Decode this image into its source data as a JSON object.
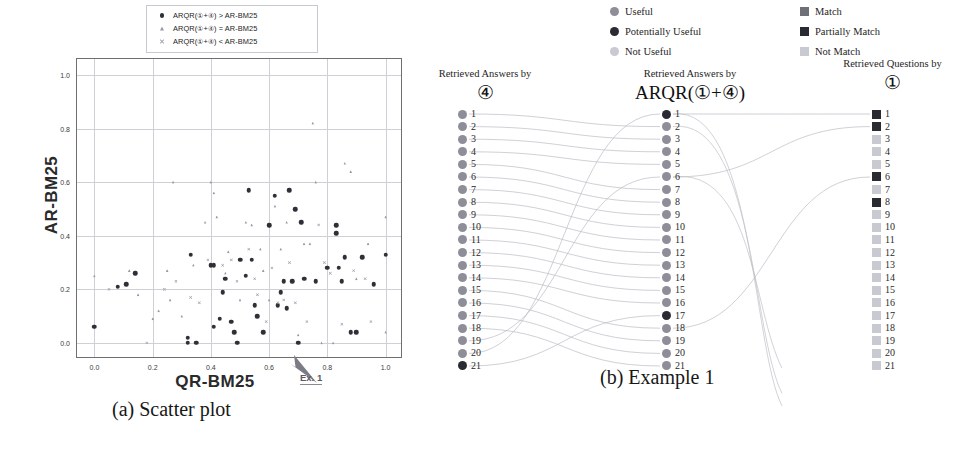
{
  "figure": {
    "caption_a": "(a) Scatter plot",
    "caption_b": "(b) Example 1"
  },
  "chart_data": {
    "type": "scatter",
    "title": "",
    "xlabel": "QR-BM25",
    "ylabel": "AR-BM25",
    "xlim": [
      -0.06,
      1.06
    ],
    "ylim": [
      -0.06,
      1.06
    ],
    "xticks": [
      "0.0",
      "0.2",
      "0.4",
      "0.6",
      "0.8",
      "1.0"
    ],
    "yticks": [
      "0.0",
      "0.2",
      "0.4",
      "0.6",
      "0.8",
      "1.0"
    ],
    "xtick_values": [
      0.0,
      0.2,
      0.4,
      0.6,
      0.8,
      1.0
    ],
    "ytick_values": [
      0.0,
      0.2,
      0.4,
      0.6,
      0.8,
      1.0
    ],
    "grid": true,
    "legend_position": "top-right",
    "annotation": {
      "text": "Ex. 1",
      "points_to_x": 0.7,
      "points_to_y": 0.0
    },
    "series": [
      {
        "name": "ARQR(①+④) > AR-BM25",
        "marker": "filled-circle",
        "color": "#2f2f37",
        "points": [
          [
            0.0,
            0.06
          ],
          [
            0.08,
            0.21
          ],
          [
            0.11,
            0.22
          ],
          [
            0.14,
            0.26
          ],
          [
            0.32,
            0.0
          ],
          [
            0.32,
            0.02
          ],
          [
            0.33,
            0.33
          ],
          [
            0.35,
            0.0
          ],
          [
            0.4,
            0.29
          ],
          [
            0.41,
            0.29
          ],
          [
            0.41,
            0.06
          ],
          [
            0.43,
            0.09
          ],
          [
            0.44,
            0.19
          ],
          [
            0.45,
            0.24
          ],
          [
            0.47,
            0.08
          ],
          [
            0.48,
            0.04
          ],
          [
            0.49,
            0.0
          ],
          [
            0.5,
            0.31
          ],
          [
            0.52,
            0.25
          ],
          [
            0.53,
            0.57
          ],
          [
            0.54,
            0.31
          ],
          [
            0.55,
            0.14
          ],
          [
            0.56,
            0.1
          ],
          [
            0.58,
            0.04
          ],
          [
            0.6,
            0.44
          ],
          [
            0.62,
            0.55
          ],
          [
            0.63,
            0.14
          ],
          [
            0.64,
            0.19
          ],
          [
            0.65,
            0.23
          ],
          [
            0.66,
            0.13
          ],
          [
            0.67,
            0.57
          ],
          [
            0.68,
            0.23
          ],
          [
            0.69,
            0.5
          ],
          [
            0.7,
            0.0
          ],
          [
            0.71,
            0.45
          ],
          [
            0.72,
            0.24
          ],
          [
            0.76,
            0.23
          ],
          [
            0.8,
            0.28
          ],
          [
            0.83,
            0.44
          ],
          [
            0.83,
            0.41
          ],
          [
            0.84,
            0.28
          ],
          [
            0.85,
            0.23
          ],
          [
            0.86,
            0.32
          ],
          [
            0.88,
            0.04
          ],
          [
            0.9,
            0.04
          ],
          [
            0.92,
            0.32
          ],
          [
            0.96,
            0.22
          ],
          [
            1.0,
            0.33
          ]
        ]
      },
      {
        "name": "ARQR(①+④) = AR-BM25",
        "marker": "triangle",
        "color": "#9a9aa4",
        "points": [
          [
            0.0,
            0.25
          ],
          [
            0.12,
            0.27
          ],
          [
            0.15,
            0.18
          ],
          [
            0.2,
            0.09
          ],
          [
            0.22,
            0.12
          ],
          [
            0.25,
            0.27
          ],
          [
            0.26,
            0.16
          ],
          [
            0.27,
            0.6
          ],
          [
            0.3,
            0.1
          ],
          [
            0.34,
            0.29
          ],
          [
            0.38,
            0.45
          ],
          [
            0.4,
            0.6
          ],
          [
            0.41,
            0.56
          ],
          [
            0.42,
            0.47
          ],
          [
            0.45,
            0.26
          ],
          [
            0.46,
            0.34
          ],
          [
            0.5,
            0.16
          ],
          [
            0.52,
            0.45
          ],
          [
            0.54,
            0.44
          ],
          [
            0.57,
            0.35
          ],
          [
            0.58,
            0.27
          ],
          [
            0.6,
            0.16
          ],
          [
            0.62,
            0.51
          ],
          [
            0.64,
            0.35
          ],
          [
            0.66,
            0.45
          ],
          [
            0.7,
            0.03
          ],
          [
            0.72,
            0.37
          ],
          [
            0.74,
            0.37
          ],
          [
            0.75,
            0.82
          ],
          [
            0.76,
            0.6
          ],
          [
            0.78,
            0.0
          ],
          [
            0.82,
            0.0
          ],
          [
            0.86,
            0.67
          ],
          [
            0.88,
            0.64
          ],
          [
            0.9,
            0.24
          ],
          [
            0.94,
            0.37
          ],
          [
            1.0,
            0.47
          ],
          [
            1.0,
            0.04
          ]
        ]
      },
      {
        "name": "ARQR(①+④) < AR-BM25",
        "marker": "cross",
        "color": "#a7a7b0",
        "points": [
          [
            0.05,
            0.2
          ],
          [
            0.18,
            0.0
          ],
          [
            0.24,
            0.2
          ],
          [
            0.28,
            0.23
          ],
          [
            0.33,
            0.17
          ],
          [
            0.36,
            0.15
          ],
          [
            0.39,
            0.31
          ],
          [
            0.44,
            0.29
          ],
          [
            0.47,
            0.31
          ],
          [
            0.49,
            0.23
          ],
          [
            0.53,
            0.35
          ],
          [
            0.55,
            0.24
          ],
          [
            0.56,
            0.18
          ],
          [
            0.59,
            0.08
          ],
          [
            0.61,
            0.28
          ],
          [
            0.63,
            0.15
          ],
          [
            0.65,
            0.16
          ],
          [
            0.67,
            0.3
          ],
          [
            0.69,
            0.15
          ],
          [
            0.73,
            0.08
          ],
          [
            0.77,
            0.44
          ],
          [
            0.79,
            0.3
          ],
          [
            0.81,
            0.26
          ],
          [
            0.85,
            0.07
          ],
          [
            0.89,
            0.27
          ],
          [
            0.93,
            0.24
          ],
          [
            0.95,
            0.08
          ]
        ]
      }
    ]
  },
  "panel_b": {
    "legend": {
      "circle_items": [
        {
          "label": "Useful",
          "color": "#8e8e98"
        },
        {
          "label": "Potentially Useful",
          "color": "#2a2a32"
        },
        {
          "label": "Not Useful",
          "color": "#c9c9d1"
        }
      ],
      "square_items": [
        {
          "label": "Match",
          "color": "#6f6f78"
        },
        {
          "label": "Partially Match",
          "color": "#2a2a32"
        },
        {
          "label": "Not Match",
          "color": "#c9c9d1"
        }
      ]
    },
    "columns": [
      {
        "header_sub": "Retrieved Answers by",
        "header_main": "④",
        "marker_shape": "circle",
        "items": [
          {
            "n": "1",
            "state": "Useful"
          },
          {
            "n": "2",
            "state": "Useful"
          },
          {
            "n": "3",
            "state": "Useful"
          },
          {
            "n": "4",
            "state": "Useful"
          },
          {
            "n": "5",
            "state": "Useful"
          },
          {
            "n": "6",
            "state": "Useful"
          },
          {
            "n": "7",
            "state": "Useful"
          },
          {
            "n": "8",
            "state": "Useful"
          },
          {
            "n": "9",
            "state": "Useful"
          },
          {
            "n": "10",
            "state": "Useful"
          },
          {
            "n": "11",
            "state": "Useful"
          },
          {
            "n": "12",
            "state": "Useful"
          },
          {
            "n": "13",
            "state": "Useful"
          },
          {
            "n": "14",
            "state": "Useful"
          },
          {
            "n": "15",
            "state": "Useful"
          },
          {
            "n": "16",
            "state": "Useful"
          },
          {
            "n": "17",
            "state": "Useful"
          },
          {
            "n": "18",
            "state": "Useful"
          },
          {
            "n": "19",
            "state": "Useful"
          },
          {
            "n": "20",
            "state": "Useful"
          },
          {
            "n": "21",
            "state": "Potentially Useful"
          }
        ]
      },
      {
        "header_sub": "Retrieved Answers by",
        "header_main": "ARQR(①+④)",
        "marker_shape": "circle",
        "items": [
          {
            "n": "1",
            "state": "Potentially Useful"
          },
          {
            "n": "2",
            "state": "Useful"
          },
          {
            "n": "3",
            "state": "Useful"
          },
          {
            "n": "4",
            "state": "Useful"
          },
          {
            "n": "5",
            "state": "Useful"
          },
          {
            "n": "6",
            "state": "Useful"
          },
          {
            "n": "7",
            "state": "Useful"
          },
          {
            "n": "8",
            "state": "Useful"
          },
          {
            "n": "9",
            "state": "Useful"
          },
          {
            "n": "10",
            "state": "Useful"
          },
          {
            "n": "11",
            "state": "Useful"
          },
          {
            "n": "12",
            "state": "Useful"
          },
          {
            "n": "13",
            "state": "Useful"
          },
          {
            "n": "14",
            "state": "Useful"
          },
          {
            "n": "15",
            "state": "Useful"
          },
          {
            "n": "16",
            "state": "Useful"
          },
          {
            "n": "17",
            "state": "Potentially Useful"
          },
          {
            "n": "18",
            "state": "Useful"
          },
          {
            "n": "19",
            "state": "Useful"
          },
          {
            "n": "20",
            "state": "Useful"
          },
          {
            "n": "21",
            "state": "Useful"
          }
        ]
      },
      {
        "header_sub": "Retrieved Questions by",
        "header_main": "①",
        "marker_shape": "square",
        "items": [
          {
            "n": "1",
            "state": "Partially Match"
          },
          {
            "n": "2",
            "state": "Partially Match"
          },
          {
            "n": "3",
            "state": "Not Match"
          },
          {
            "n": "4",
            "state": "Not Match"
          },
          {
            "n": "5",
            "state": "Not Match"
          },
          {
            "n": "6",
            "state": "Partially Match"
          },
          {
            "n": "7",
            "state": "Not Match"
          },
          {
            "n": "8",
            "state": "Partially Match"
          },
          {
            "n": "9",
            "state": "Not Match"
          },
          {
            "n": "10",
            "state": "Not Match"
          },
          {
            "n": "11",
            "state": "Not Match"
          },
          {
            "n": "12",
            "state": "Not Match"
          },
          {
            "n": "13",
            "state": "Not Match"
          },
          {
            "n": "14",
            "state": "Not Match"
          },
          {
            "n": "15",
            "state": "Not Match"
          },
          {
            "n": "16",
            "state": "Not Match"
          },
          {
            "n": "17",
            "state": "Not Match"
          },
          {
            "n": "18",
            "state": "Not Match"
          },
          {
            "n": "19",
            "state": "Not Match"
          },
          {
            "n": "20",
            "state": "Not Match"
          },
          {
            "n": "21",
            "state": "Not Match"
          }
        ]
      }
    ],
    "links_left_to_mid": [
      [
        1,
        2
      ],
      [
        2,
        3
      ],
      [
        3,
        4
      ],
      [
        4,
        5
      ],
      [
        5,
        7
      ],
      [
        6,
        8
      ],
      [
        7,
        9
      ],
      [
        8,
        10
      ],
      [
        9,
        11
      ],
      [
        10,
        12
      ],
      [
        11,
        13
      ],
      [
        12,
        14
      ],
      [
        13,
        15
      ],
      [
        14,
        16
      ],
      [
        15,
        18
      ],
      [
        16,
        19
      ],
      [
        17,
        20
      ],
      [
        18,
        21
      ],
      [
        19,
        6
      ],
      [
        20,
        1
      ],
      [
        21,
        17
      ]
    ],
    "links_mid_to_right": [
      [
        1,
        1
      ],
      [
        6,
        2
      ],
      [
        18,
        6
      ]
    ]
  },
  "colors": {
    "useful": "#8e8e98",
    "potentially_useful": "#2a2a32",
    "not_useful": "#c9c9d1",
    "match": "#6f6f78",
    "partially_match": "#2a2a32",
    "not_match": "#c9c9d1",
    "link": "#b9b9c2",
    "grid": "#cfcfd6"
  }
}
